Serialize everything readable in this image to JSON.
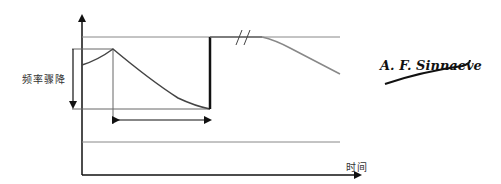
{
  "diagram": {
    "title": "",
    "y_axis_label": "频率骤降",
    "x_axis_label": "时间",
    "signature": "A. F. Sinnaeve",
    "colors": {
      "axis": "#111111",
      "curve": "#444444",
      "guide": "#888888",
      "recovery": "#111111"
    },
    "elements": [
      {
        "id": "y-axis",
        "type": "arrow",
        "from": [
          82,
          175
        ],
        "to": [
          82,
          14
        ]
      },
      {
        "id": "x-axis",
        "type": "arrow",
        "from": [
          82,
          175
        ],
        "to": [
          360,
          175
        ]
      },
      {
        "id": "baseline-upper",
        "type": "line",
        "from": [
          82,
          37
        ],
        "to": [
          340,
          37
        ]
      },
      {
        "id": "baseline-lower",
        "type": "line",
        "from": [
          82,
          142
        ],
        "to": [
          340,
          142
        ]
      },
      {
        "id": "peak-level",
        "type": "line",
        "from": [
          73,
          49
        ],
        "to": [
          113,
          49
        ]
      },
      {
        "id": "trough-level",
        "type": "line",
        "from": [
          73,
          108
        ],
        "to": [
          210,
          108
        ]
      },
      {
        "id": "drop-arrow",
        "type": "arrow",
        "from": [
          73,
          49
        ],
        "to": [
          73,
          108
        ]
      },
      {
        "id": "duration-arrow",
        "type": "double-arrow",
        "from": [
          115,
          120
        ],
        "to": [
          210,
          120
        ]
      },
      {
        "id": "peak-marker",
        "type": "line",
        "from": [
          113,
          49
        ],
        "to": [
          113,
          123
        ]
      },
      {
        "id": "break-marks",
        "type": "break",
        "at": [
          244,
          37
        ]
      }
    ]
  }
}
